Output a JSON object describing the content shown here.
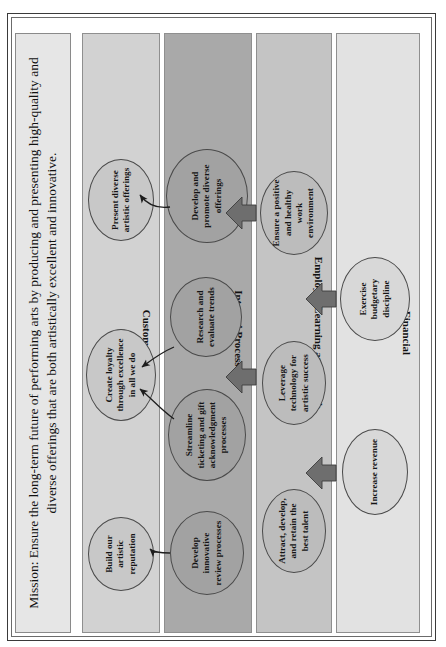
{
  "document": {
    "type": "strategy-map",
    "orientation": "rotated-90-counterclockwise"
  },
  "mission": {
    "label": "Mission",
    "text": "Mission: Ensure the long-term future of performing arts by producing and presenting high-quality and diverse offerings that are both artistically excellent and innovative."
  },
  "colors": {
    "mission_band": "#e6e6e6",
    "customer_band": "#d2d2d2",
    "internal_band": "#a9a9a9",
    "employee_band": "#c4c4c4",
    "financial_band": "#e2e2e2",
    "oval_border": "#4a4a4a",
    "arrow_fill": "#6e6e6e",
    "frame": "#3a3a3a"
  },
  "perspectives": [
    {
      "id": "customer",
      "label": "Customer",
      "objectives": [
        {
          "id": "present-diverse-artistic-offerings",
          "text": "Present diverse artistic offerings"
        },
        {
          "id": "create-loyalty-through-excellence",
          "text": "Create loyalty through excellence in all we do"
        },
        {
          "id": "build-our-artistic-reputation",
          "text": "Build our artistic reputation"
        }
      ]
    },
    {
      "id": "internal-processes",
      "label": "Internal Processes",
      "objectives": [
        {
          "id": "develop-and-promote-diverse-offerings",
          "text": "Develop and promote diverse offerings"
        },
        {
          "id": "research-and-evaluate-trends",
          "text": "Research and evaluate trends"
        },
        {
          "id": "streamline-ticketing-and-gift",
          "text": "Streamline ticketing and gift acknowledgment processes"
        },
        {
          "id": "develop-innovative-review-processes",
          "text": "Develop innovative review processes"
        }
      ]
    },
    {
      "id": "employee-learning-and-growth",
      "label": "Employee Learning and Growth",
      "objectives": [
        {
          "id": "ensure-positive-healthy-work-environment",
          "text": "Ensure a positive and healthy work environment"
        },
        {
          "id": "leverage-technology-for-artistic-success",
          "text": "Leverage technology for artistic success"
        },
        {
          "id": "attract-develop-retain-best-talent",
          "text": "Attract, develop, and retain the best talent"
        }
      ]
    },
    {
      "id": "financial",
      "label": "Financial",
      "objectives": [
        {
          "id": "exercise-budgetary-discipline",
          "text": "Exercise budgetary discipline"
        },
        {
          "id": "increase-revenue",
          "text": "Increase revenue"
        }
      ]
    }
  ]
}
